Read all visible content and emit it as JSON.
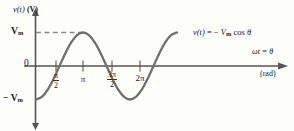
{
  "figure": {
    "y_axis_label": "v(t)",
    "y_axis_unit": "(V)",
    "y_ticks": [
      {
        "label_main": "V",
        "label_sub": "m",
        "prefix": "",
        "value": 1
      },
      {
        "label_main": "0",
        "label_sub": "",
        "prefix": "",
        "value": 0
      },
      {
        "label_main": "V",
        "label_sub": "m",
        "prefix": "− ",
        "value": -1
      }
    ],
    "x_axis_variable": "ωt  =  θ",
    "x_axis_unit": "(rad)",
    "equation": {
      "lhs": "v(t)",
      "relation": "  =  − ",
      "amplitude": "V",
      "amplitude_sub": "m",
      "function": " cos ",
      "argument": "θ"
    },
    "x_ticks": [
      {
        "type": "fraction",
        "num": "π",
        "den": "2",
        "x": 56
      },
      {
        "type": "plain",
        "text": "π",
        "x": 83
      },
      {
        "type": "fraction",
        "num": "3π",
        "den": "2",
        "x": 112
      },
      {
        "type": "plain",
        "text": "2π",
        "x": 140
      }
    ],
    "colors": {
      "curve": "#6f6f6f",
      "axis": "#555555",
      "dashed_guide": "#8a8a8a",
      "background": "#fdfdfa",
      "text": "#222222"
    }
  },
  "chart_data": {
    "type": "line",
    "title": "",
    "subtitle": "",
    "xlabel": "ωt = θ (rad)",
    "ylabel": "v(t) (V)",
    "grid": false,
    "legend_position": "inline-annotation",
    "annotations": [
      {
        "text": "v(t)  =  − Vm cos θ",
        "x": 3.14159,
        "y": 1.0
      }
    ],
    "xlim": [
      0,
      9.8
    ],
    "ylim": [
      -1.35,
      1.35
    ],
    "xtick_values": [
      1.5708,
      3.14159,
      4.71239,
      6.28319
    ],
    "xtick_labels": [
      "π/2",
      "π",
      "3π/2",
      "2π"
    ],
    "ytick_values": [
      1,
      0,
      -1
    ],
    "ytick_labels": [
      "Vm",
      "0",
      "−Vm"
    ],
    "guides": [
      {
        "type": "hline-dashed",
        "y": 1.0,
        "x_from": 0,
        "x_to": 3.14159
      }
    ],
    "series": [
      {
        "name": "v(t) = −Vm cos θ",
        "formula": "y = -cos(x)",
        "x": [
          0,
          0.3927,
          0.7854,
          1.1781,
          1.5708,
          1.9635,
          2.3562,
          2.7489,
          3.14159,
          3.5343,
          3.927,
          4.3197,
          4.71239,
          5.1051,
          5.4978,
          5.8905,
          6.28319,
          6.6759,
          7.0686,
          7.4613,
          7.854,
          8.2467,
          8.6394,
          9.0321,
          9.42478
        ],
        "values": [
          -1,
          -0.9239,
          -0.7071,
          -0.3827,
          0,
          0.3827,
          0.7071,
          0.9239,
          1,
          0.9239,
          0.7071,
          0.3827,
          0,
          -0.3827,
          -0.7071,
          -0.9239,
          -1,
          -0.9239,
          -0.7071,
          -0.3827,
          0,
          0.3827,
          0.7071,
          0.9239,
          1
        ]
      }
    ]
  }
}
